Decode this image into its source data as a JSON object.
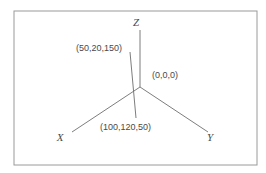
{
  "figure": {
    "frame": {
      "x": 14,
      "y": 11,
      "width": 243,
      "height": 154,
      "stroke_color": "#9a9a9a"
    },
    "line_color": "#6e6e6e",
    "text_color": "#4a4a4a",
    "background_color": "#ffffff",
    "origin": {
      "x": 140,
      "y": 87
    },
    "axes": [
      {
        "name": "z-axis",
        "label": "Z",
        "label_x": 136,
        "label_y": 26,
        "end_x": 140,
        "end_y": 30
      },
      {
        "name": "x-axis",
        "label": "X",
        "label_x": 60,
        "label_y": 141,
        "end_x": 72,
        "end_y": 132
      },
      {
        "name": "y-axis",
        "label": "Y",
        "label_x": 210,
        "label_y": 141,
        "end_x": 208,
        "end_y": 132
      }
    ],
    "leader_line": {
      "name": "point-leader-line",
      "x1": 130,
      "y1": 52,
      "x2": 136,
      "y2": 118
    },
    "labels": [
      {
        "name": "coordinate-label-50-20-150",
        "text": "(50,20,150)",
        "x": 76,
        "y": 51,
        "anchor": "start"
      },
      {
        "name": "coordinate-label-origin",
        "text": "(0,0,0)",
        "x": 152,
        "y": 78,
        "anchor": "start"
      },
      {
        "name": "coordinate-label-100-120-50",
        "text": "(100,120,50)",
        "x": 100,
        "y": 130,
        "anchor": "start"
      }
    ]
  }
}
